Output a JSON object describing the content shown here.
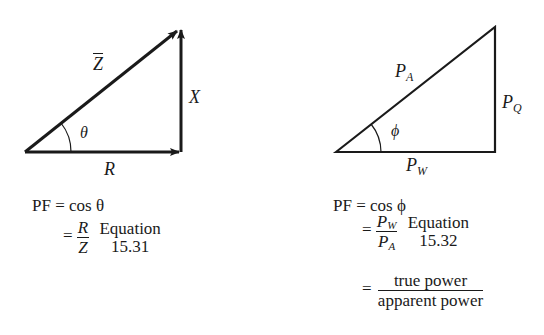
{
  "left_diagram": {
    "type": "impedance-triangle",
    "hypotenuse_label": "Z",
    "vertical_label": "X",
    "base_label": "R",
    "angle_label": "θ"
  },
  "right_diagram": {
    "type": "power-triangle",
    "hypotenuse_label": "P",
    "hypotenuse_sub": "A",
    "vertical_label": "P",
    "vertical_sub": "Q",
    "base_label": "P",
    "base_sub": "W",
    "angle_label": "ϕ"
  },
  "left_equation": {
    "line1_lhs": "PF =",
    "line1_rhs": "cos θ",
    "eq_sign": "=",
    "frac_num": "R",
    "frac_den": "Z",
    "ref_word": "Equation",
    "ref_num": "15.31"
  },
  "right_equation": {
    "line1_lhs": "PF =",
    "line1_rhs": "cos ϕ",
    "eq_sign": "=",
    "frac_num": "P",
    "frac_num_sub": "W",
    "frac_den": "P",
    "frac_den_sub": "A",
    "ref_word": "Equation",
    "ref_num": "15.32",
    "line3_eq": "=",
    "line3_num": "true power",
    "line3_den": "apparent power"
  }
}
